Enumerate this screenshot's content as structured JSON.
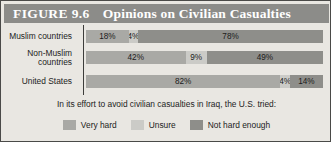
{
  "figure": {
    "number_label": "FIGURE 9.6",
    "title": "Opinions on Civilian Casualties",
    "caption": "In its effort to avoid civilian casualties in Iraq, the U.S. tried:"
  },
  "colors": {
    "very_hard": "#a9a9a5",
    "unsure": "#cbcbc7",
    "not_hard_enough": "#8e8e8a",
    "title_band": "#8c8c89",
    "background": "#e9e7e2",
    "border": "#4a4a48"
  },
  "legend": {
    "items": [
      {
        "label": "Very hard",
        "color_key": "very_hard"
      },
      {
        "label": "Unsure",
        "color_key": "unsure"
      },
      {
        "label": "Not hard enough",
        "color_key": "not_hard_enough"
      }
    ]
  },
  "chart_data": {
    "type": "bar",
    "orientation": "horizontal",
    "stacked": true,
    "title": "Opinions on Civilian Casualties",
    "subtitle": "In its effort to avoid civilian casualties in Iraq, the U.S. tried:",
    "xlabel": "",
    "ylabel": "",
    "xlim": [
      0,
      100
    ],
    "grid": false,
    "legend_position": "bottom",
    "units": "percent",
    "categories": [
      "Muslim countries",
      "Non-Muslim countries",
      "United States"
    ],
    "series": [
      {
        "name": "Very hard",
        "values": [
          18,
          42,
          82
        ]
      },
      {
        "name": "Unsure",
        "values": [
          4,
          9,
          4
        ]
      },
      {
        "name": "Not hard enough",
        "values": [
          78,
          49,
          14
        ]
      }
    ],
    "rows": [
      {
        "category": "Muslim countries",
        "category_display": "Muslim countries",
        "segments": [
          {
            "series": "Very hard",
            "value": 18,
            "label": "18%"
          },
          {
            "series": "Unsure",
            "value": 4,
            "label": "4%"
          },
          {
            "series": "Not hard enough",
            "value": 78,
            "label": "78%"
          }
        ]
      },
      {
        "category": "Non-Muslim countries",
        "category_display": "Non-Muslim\ncountries",
        "segments": [
          {
            "series": "Very hard",
            "value": 42,
            "label": "42%"
          },
          {
            "series": "Unsure",
            "value": 9,
            "label": "9%"
          },
          {
            "series": "Not hard enough",
            "value": 49,
            "label": "49%"
          }
        ]
      },
      {
        "category": "United States",
        "category_display": "United States",
        "segments": [
          {
            "series": "Very hard",
            "value": 82,
            "label": "82%"
          },
          {
            "series": "Unsure",
            "value": 4,
            "label": "4%"
          },
          {
            "series": "Not hard enough",
            "value": 14,
            "label": "14%"
          }
        ]
      }
    ]
  }
}
